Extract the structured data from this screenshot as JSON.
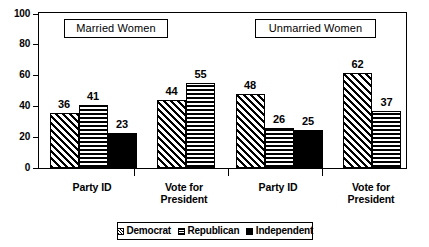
{
  "chart_data": {
    "type": "bar",
    "title": "",
    "xlabel": "",
    "ylabel": "",
    "ylim": [
      0,
      100
    ],
    "yticks": [
      0,
      20,
      40,
      60,
      80,
      100
    ],
    "grid": false,
    "legend_position": "bottom",
    "panels": [
      {
        "label": "Married Women",
        "groups": [
          {
            "category": "Party ID",
            "bars": [
              {
                "series": "Democrat",
                "value": 36
              },
              {
                "series": "Republican",
                "value": 41
              },
              {
                "series": "Independent",
                "value": 23
              }
            ]
          },
          {
            "category": "Vote for President",
            "bars": [
              {
                "series": "Democrat",
                "value": 44
              },
              {
                "series": "Republican",
                "value": 55
              }
            ]
          }
        ]
      },
      {
        "label": "Unmarried Women",
        "groups": [
          {
            "category": "Party ID",
            "bars": [
              {
                "series": "Democrat",
                "value": 48
              },
              {
                "series": "Republican",
                "value": 26
              },
              {
                "series": "Independent",
                "value": 25
              }
            ]
          },
          {
            "category": "Vote for President",
            "bars": [
              {
                "series": "Democrat",
                "value": 62
              },
              {
                "series": "Republican",
                "value": 37
              }
            ]
          }
        ]
      }
    ],
    "series_names": [
      "Democrat",
      "Republican",
      "Independent"
    ],
    "categories": [
      "Party ID",
      "Vote for President",
      "Party ID",
      "Vote for President"
    ],
    "series": [
      {
        "name": "Democrat",
        "values": [
          36,
          44,
          48,
          62
        ]
      },
      {
        "name": "Republican",
        "values": [
          41,
          55,
          26,
          37
        ]
      },
      {
        "name": "Independent",
        "values": [
          23,
          null,
          25,
          null
        ]
      }
    ]
  },
  "axis": {
    "y_tick_labels": [
      "100",
      "80",
      "60",
      "40",
      "20",
      "0"
    ],
    "x_category_labels": [
      "Party ID",
      "Vote for\nPresident",
      "Party ID",
      "Vote for\nPresident"
    ]
  },
  "panel_titles": [
    "Married Women",
    "Unmarried Women"
  ],
  "legend": {
    "items": [
      {
        "label": "Democrat",
        "pattern": "diagonal-hatch"
      },
      {
        "label": "Republican",
        "pattern": "horizontal-lines"
      },
      {
        "label": "Independent",
        "pattern": "solid-black"
      }
    ]
  },
  "colors": {
    "foreground": "#000000",
    "background": "#ffffff"
  }
}
